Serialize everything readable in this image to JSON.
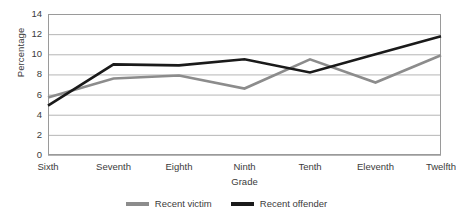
{
  "chart_data": {
    "type": "line",
    "title": "",
    "xlabel": "Grade",
    "ylabel": "Percentage",
    "categories": [
      "Sixth",
      "Seventh",
      "Eighth",
      "Ninth",
      "Tenth",
      "Eleventh",
      "Twelfth"
    ],
    "ylim": [
      0,
      14
    ],
    "ytick_step": 2,
    "yticks": [
      14,
      12,
      10,
      8,
      6,
      4,
      2,
      0
    ],
    "grid": "horizontal",
    "legend_position": "bottom",
    "series": [
      {
        "name": "Recent victim",
        "color": "#8c8c8c",
        "values": [
          5.7,
          7.6,
          7.9,
          6.6,
          9.5,
          7.2,
          9.9
        ]
      },
      {
        "name": "Recent offender",
        "color": "#1a1a1a",
        "values": [
          4.9,
          9.0,
          8.9,
          9.5,
          8.2,
          10.0,
          11.8
        ]
      }
    ]
  },
  "plot": {
    "left": 48,
    "right": 441,
    "top": 14,
    "bottom": 155,
    "border_color": "#9a9a9a",
    "gridline_color": "#b5b5b5",
    "background": "#ffffff"
  }
}
